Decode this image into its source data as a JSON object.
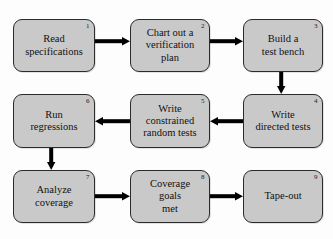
{
  "diagram": {
    "colors": {
      "node_fill": "#c9c9c9",
      "node_border": "#2b2b2b",
      "arrow": "#000000",
      "background": "#fdfdfd",
      "text": "#111111"
    },
    "nodes": [
      {
        "id": "n1",
        "number": "1",
        "label": "Read\nspecifications",
        "x": 13,
        "y": 19,
        "w": 82,
        "h": 53
      },
      {
        "id": "n2",
        "number": "2",
        "label": "Chart out a\nverification\nplan",
        "x": 130,
        "y": 19,
        "w": 80,
        "h": 53
      },
      {
        "id": "n3",
        "number": "3",
        "label": "Build a\ntest bench",
        "x": 243,
        "y": 19,
        "w": 80,
        "h": 53
      },
      {
        "id": "n4",
        "number": "4",
        "label": "Write\ndirected tests",
        "x": 243,
        "y": 94,
        "w": 80,
        "h": 54
      },
      {
        "id": "n5",
        "number": "5",
        "label": "Write\nconstrained\nrandom tests",
        "x": 130,
        "y": 94,
        "w": 80,
        "h": 54
      },
      {
        "id": "n6",
        "number": "6",
        "label": "Run\nregressions",
        "x": 13,
        "y": 94,
        "w": 82,
        "h": 54
      },
      {
        "id": "n7",
        "number": "7",
        "label": "Analyze\ncoverage",
        "x": 13,
        "y": 170,
        "w": 82,
        "h": 53
      },
      {
        "id": "n8",
        "number": "8",
        "label": "Coverage\ngoals\nmet",
        "x": 130,
        "y": 170,
        "w": 80,
        "h": 53
      },
      {
        "id": "n9",
        "number": "9",
        "label": "Tape-out",
        "x": 243,
        "y": 170,
        "w": 80,
        "h": 53
      }
    ],
    "arrows": [
      {
        "id": "a1",
        "name": "arrow-read-specifications-to-chart-out-a-verification-plan",
        "from": "n1",
        "to": "n2",
        "direction": "right",
        "x": 95,
        "y": 41.5,
        "length": 35,
        "thickness": 4
      },
      {
        "id": "a2",
        "name": "arrow-chart-out-a-verification-plan-to-build-a-test-bench",
        "from": "n2",
        "to": "n3",
        "direction": "right",
        "x": 210,
        "y": 41.5,
        "length": 33,
        "thickness": 4
      },
      {
        "id": "a3",
        "name": "arrow-build-a-test-bench-to-write-directed-tests",
        "from": "n3",
        "to": "n4",
        "direction": "down",
        "x": 281,
        "y": 72,
        "length": 22,
        "thickness": 4
      },
      {
        "id": "a4",
        "name": "arrow-write-directed-tests-to-write-constrained-random-tests",
        "from": "n4",
        "to": "n5",
        "direction": "left",
        "x": 210,
        "y": 121,
        "length": 33,
        "thickness": 4
      },
      {
        "id": "a5",
        "name": "arrow-write-constrained-random-tests-to-run-regressions",
        "from": "n5",
        "to": "n6",
        "direction": "left",
        "x": 95,
        "y": 121,
        "length": 35,
        "thickness": 4
      },
      {
        "id": "a6",
        "name": "arrow-run-regressions-to-analyze-coverage",
        "from": "n6",
        "to": "n7",
        "direction": "down",
        "x": 51,
        "y": 148,
        "length": 22,
        "thickness": 4
      },
      {
        "id": "a7",
        "name": "arrow-analyze-coverage-to-coverage-goals-met",
        "from": "n7",
        "to": "n8",
        "direction": "right",
        "x": 95,
        "y": 196.5,
        "length": 35,
        "thickness": 4
      },
      {
        "id": "a8",
        "name": "arrow-coverage-goals-met-to-tape-out",
        "from": "n8",
        "to": "n9",
        "direction": "right",
        "x": 210,
        "y": 196.5,
        "length": 33,
        "thickness": 4
      }
    ]
  }
}
